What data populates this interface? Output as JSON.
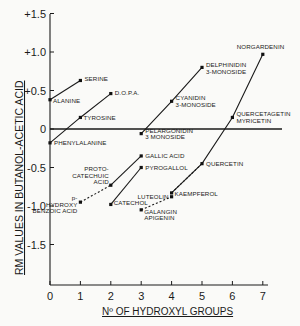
{
  "chart_data": {
    "type": "line",
    "title": "",
    "xlabel": "Nº OF HYDROXYL GROUPS",
    "ylabel": "RM VALUES IN BUTANOL-ACETIC ACID",
    "xlim": [
      0,
      7
    ],
    "ylim": [
      -2.0,
      1.5
    ],
    "x_ticks": [
      "0",
      "1",
      "2",
      "3",
      "4",
      "5",
      "6",
      "7"
    ],
    "y_ticks": [
      "+1.5",
      "+1.0",
      "+0.5",
      "0",
      "-0.5",
      "-1.0",
      "-1.5"
    ],
    "grid": false,
    "zero_line": true,
    "points": [
      {
        "name": "SERINE",
        "x": 1,
        "y": 0.63
      },
      {
        "name": "ALANINE",
        "x": 0,
        "y": 0.38
      },
      {
        "name": "D.O.P.A.",
        "x": 2,
        "y": 0.46
      },
      {
        "name": "TYROSINE",
        "x": 1,
        "y": 0.15
      },
      {
        "name": "PHENYLALANINE",
        "x": 0,
        "y": -0.18
      },
      {
        "name": "PELARGONIDIN 3 MONOSIDE",
        "x": 3,
        "y": -0.06
      },
      {
        "name": "CYANIDIN 3-MONOSIDE",
        "x": 4,
        "y": 0.36
      },
      {
        "name": "DELPHINIDIN 3-MONOSIDE",
        "x": 5,
        "y": 0.8
      },
      {
        "name": "NORGARDENIN",
        "x": 7,
        "y": 0.97
      },
      {
        "name": "QUERCETAGETIN MYRICETIN",
        "x": 6,
        "y": 0.15
      },
      {
        "name": "GALLIC ACID",
        "x": 3,
        "y": -0.35
      },
      {
        "name": "PYROGALLOL",
        "x": 3,
        "y": -0.5
      },
      {
        "name": "QUERCETIN",
        "x": 5,
        "y": -0.45
      },
      {
        "name": "PROTO-CATECHUIC ACID",
        "x": 2,
        "y": -0.73
      },
      {
        "name": "p-HYDROXY BENZOIC ACID",
        "x": 1,
        "y": -0.95
      },
      {
        "name": "CATECHOL",
        "x": 2,
        "y": -0.98
      },
      {
        "name": "LUTEOLIN",
        "x": 4,
        "y": -0.88
      },
      {
        "name": "KAEMPFEROL",
        "x": 4,
        "y": -0.83
      },
      {
        "name": "GALANGIN APIGENIN",
        "x": 3,
        "y": -1.05
      }
    ],
    "series": [
      {
        "name": "Serine-Alanine",
        "style": "solid",
        "x": [
          0,
          1
        ],
        "y": [
          0.38,
          0.63
        ]
      },
      {
        "name": "Phenylalanine-Tyrosine-DOPA",
        "style": "solid",
        "x": [
          0,
          1,
          2
        ],
        "y": [
          -0.18,
          0.15,
          0.46
        ]
      },
      {
        "name": "Anthocyanins",
        "style": "solid",
        "x": [
          3,
          4,
          5
        ],
        "y": [
          -0.06,
          0.36,
          0.8
        ]
      },
      {
        "name": "Flavonols",
        "style": "solid",
        "x": [
          4,
          5,
          6,
          7
        ],
        "y": [
          -0.83,
          -0.45,
          0.15,
          0.97
        ]
      },
      {
        "name": "Protocatechuic-Gallic",
        "style": "solid",
        "x": [
          2,
          3
        ],
        "y": [
          -0.73,
          -0.35
        ]
      },
      {
        "name": "Catechol-Pyrogallol",
        "style": "solid",
        "x": [
          2,
          3
        ],
        "y": [
          -0.98,
          -0.5
        ]
      },
      {
        "name": "pHydroxybenzoic-Protocatechuic",
        "style": "dashed",
        "x": [
          1,
          2
        ],
        "y": [
          -0.95,
          -0.73
        ]
      },
      {
        "name": "Apigenin-Luteolin",
        "style": "dashed",
        "x": [
          3,
          4
        ],
        "y": [
          -1.05,
          -0.88
        ]
      },
      {
        "name": "Kaempferol-Quercetin",
        "style": "dashed",
        "x": [
          4,
          5
        ],
        "y": [
          -0.83,
          -0.45
        ]
      }
    ]
  }
}
